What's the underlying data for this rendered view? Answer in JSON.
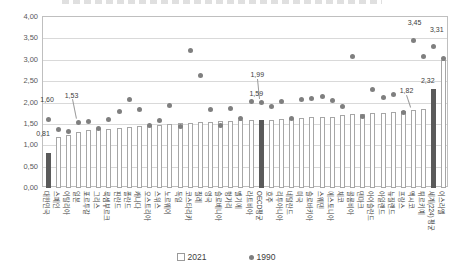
{
  "colors": {
    "bar_fill": "#ffffff",
    "bar_border": "#a6a6a6",
    "bar_dark": "#5a5a5a",
    "dot": "#7f7f7f",
    "grid": "#d9d9d9",
    "axis_text": "#595959",
    "label_text": "#3d3d3d",
    "plot_border": "#bfbfbf"
  },
  "title_visible": false,
  "chart_data": {
    "type": "bar",
    "title": "",
    "xlabel": "",
    "ylabel": "",
    "ylim": [
      0,
      4
    ],
    "ytick_step": 0.5,
    "ytick_labels": [
      "0,00",
      "0,50",
      "1,00",
      "1,50",
      "2,00",
      "2,50",
      "3,00",
      "3,50",
      "4,00"
    ],
    "grid": true,
    "legend_position": "bottom",
    "decimal_separator": ",",
    "categories": [
      "대한민국",
      "스페인",
      "이탈리아",
      "일본",
      "포르투갈",
      "그리스",
      "룩셈부르크",
      "핀란드",
      "폴란드",
      "캐나다",
      "오스트리아",
      "스위스",
      "노르웨이",
      "독일",
      "코스타리카",
      "칠레",
      "영국",
      "슬로베니아",
      "헝가리",
      "벨기에",
      "라트비아",
      "OECD평균",
      "호주",
      "리투아니아",
      "네덜란드",
      "미국",
      "슬로바키아",
      "스웨덴",
      "에스토니아",
      "체코",
      "콜롬비아",
      "덴마크",
      "아이슬란드",
      "아일랜드",
      "뉴질랜드",
      "프랑스",
      "멕시코",
      "튀르키예",
      "세계(224) 평균",
      "이스라엘"
    ],
    "series": [
      {
        "name": "2021",
        "mark": "bar",
        "values": [
          0.81,
          1.19,
          1.25,
          1.3,
          1.35,
          1.37,
          1.39,
          1.41,
          1.43,
          1.44,
          1.46,
          1.48,
          1.5,
          1.52,
          1.53,
          1.54,
          1.55,
          1.56,
          1.57,
          1.58,
          1.58,
          1.59,
          1.6,
          1.61,
          1.62,
          1.64,
          1.65,
          1.66,
          1.67,
          1.7,
          1.72,
          1.74,
          1.75,
          1.76,
          1.78,
          1.8,
          1.82,
          1.85,
          2.32,
          3.0
        ]
      },
      {
        "name": "1990",
        "mark": "scatter",
        "values": [
          1.6,
          1.36,
          1.33,
          1.53,
          1.56,
          1.39,
          1.6,
          1.78,
          2.06,
          1.83,
          1.46,
          1.58,
          1.93,
          1.45,
          3.21,
          2.62,
          1.83,
          1.46,
          1.87,
          1.62,
          2.02,
          1.99,
          1.9,
          2.03,
          1.62,
          2.08,
          2.09,
          2.13,
          2.05,
          1.9,
          3.07,
          1.67,
          2.3,
          2.11,
          2.18,
          1.77,
          3.45,
          3.07,
          3.31,
          3.02
        ]
      }
    ],
    "highlighted_bar_indices": [
      0,
      21,
      38
    ],
    "annotations": [
      {
        "text": "0,81",
        "ci": 0,
        "series": "2021",
        "dx": -5,
        "dy": -20
      },
      {
        "text": "1,60",
        "ci": 0,
        "series": "1990",
        "dx": -1,
        "dy": -21
      },
      {
        "text": "1,53",
        "ci": 3,
        "series": "1990",
        "dx": -7,
        "dy": -28,
        "leader": [
          30,
          82,
          34,
          102
        ]
      },
      {
        "text": "1,99",
        "ci": 21,
        "series": "1990",
        "dx": -4,
        "dy": -29,
        "leader": [
          215,
          62,
          217,
          82
        ]
      },
      {
        "text": "1,59",
        "ci": 21,
        "series": "2021",
        "dx": -5,
        "dy": -27
      },
      {
        "text": "1,82",
        "ci": 36,
        "series": "2021",
        "dx": -7,
        "dy": -20,
        "leader": [
          364,
          78,
          368,
          90
        ]
      },
      {
        "text": "3,45",
        "ci": 36,
        "series": "1990",
        "dx": 1,
        "dy": -19
      },
      {
        "text": "3,31",
        "ci": 38,
        "series": "1990",
        "dx": 3,
        "dy": -17
      },
      {
        "text": "2,32",
        "ci": 38,
        "series": "2021",
        "dx": -6,
        "dy": -9
      }
    ]
  }
}
